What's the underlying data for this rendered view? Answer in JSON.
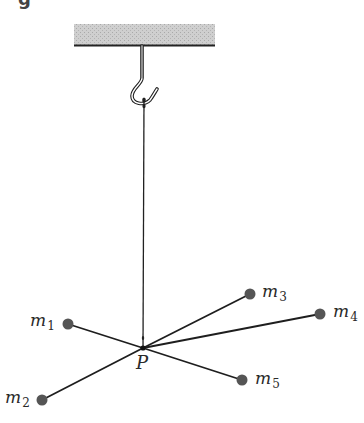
{
  "figure": {
    "partial_heading_glyph": "g",
    "ceiling": {
      "color": "#c8c8c8",
      "edge_color": "#222222"
    },
    "string_color": "#222222",
    "mass_color": "#555555",
    "junction": {
      "label": "P"
    },
    "masses": [
      {
        "id": "m1",
        "base": "m",
        "sub": "1"
      },
      {
        "id": "m2",
        "base": "m",
        "sub": "2"
      },
      {
        "id": "m3",
        "base": "m",
        "sub": "3"
      },
      {
        "id": "m4",
        "base": "m",
        "sub": "4"
      },
      {
        "id": "m5",
        "base": "m",
        "sub": "5"
      }
    ]
  }
}
